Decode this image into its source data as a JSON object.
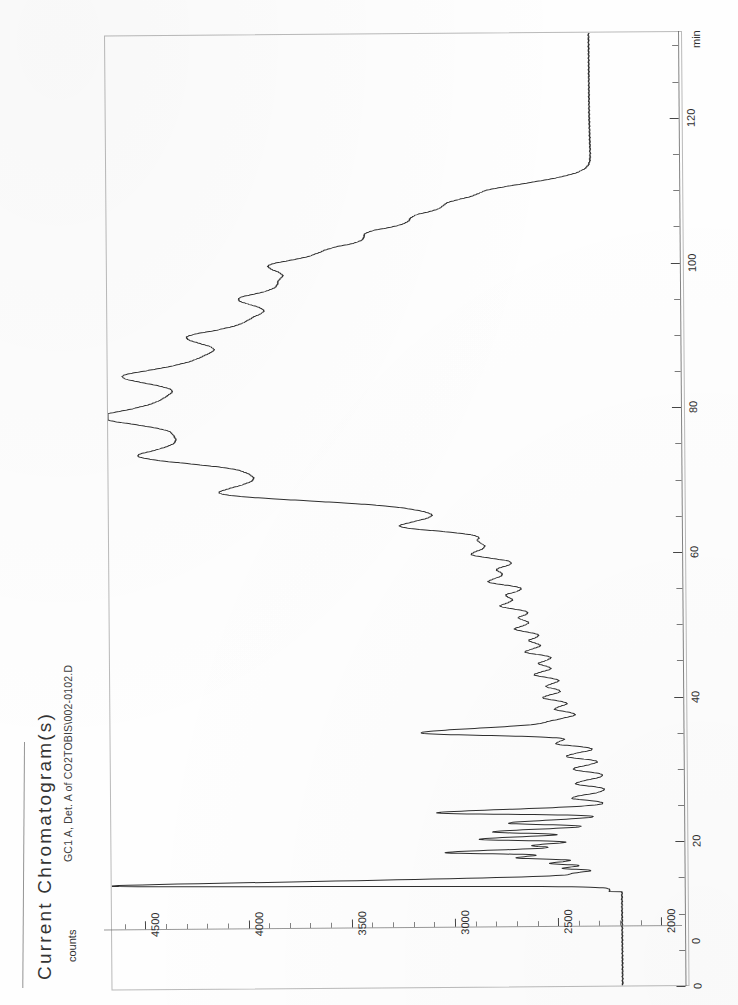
{
  "report": {
    "title": "Current Chromatogram(s)",
    "subtitle": "GC1 A, Det. A of CO2TOBIS\\002-0102.D"
  },
  "axes": {
    "x_unit": "min",
    "y_unit": "counts",
    "origin_label": "0",
    "x_ticks": [
      "0",
      "20",
      "40",
      "60",
      "80",
      "100",
      "120"
    ],
    "y_ticks": [
      "4500",
      "4000",
      "3500",
      "3000",
      "2500",
      "2000"
    ]
  },
  "chart_data": {
    "type": "line",
    "title": "Current Chromatogram(s)",
    "subtitle": "GC1 A, Det. A of CO2TOBIS\\002-0102.D",
    "xlabel": "min",
    "ylabel": "counts",
    "xlim": [
      0,
      132
    ],
    "ylim": [
      1900,
      4700
    ],
    "xticks": [
      0,
      20,
      40,
      60,
      80,
      100,
      120
    ],
    "yticks": [
      2000,
      2500,
      3000,
      3500,
      4000,
      4500
    ],
    "grid": false,
    "legend": null,
    "orientation": "rotated-90",
    "baseline": 2280,
    "series": [
      {
        "name": "Det. A signal",
        "peaks": [
          {
            "t": 14.3,
            "height": 4720,
            "width": 0.3,
            "label": "solvent"
          },
          {
            "t": 15.0,
            "height": 2460,
            "width": 0.22
          },
          {
            "t": 15.6,
            "height": 2420,
            "width": 0.2
          },
          {
            "t": 16.3,
            "height": 2500,
            "width": 0.2
          },
          {
            "t": 17.0,
            "height": 2560,
            "width": 0.22
          },
          {
            "t": 17.8,
            "height": 2720,
            "width": 0.25
          },
          {
            "t": 18.6,
            "height": 3050,
            "width": 0.26
          },
          {
            "t": 19.5,
            "height": 2620,
            "width": 0.24
          },
          {
            "t": 20.4,
            "height": 2900,
            "width": 0.26
          },
          {
            "t": 21.4,
            "height": 2830,
            "width": 0.26
          },
          {
            "t": 22.6,
            "height": 2760,
            "width": 0.28
          },
          {
            "t": 24.1,
            "height": 3110,
            "width": 0.3
          },
          {
            "t": 26.0,
            "height": 2450,
            "width": 0.35
          },
          {
            "t": 28.0,
            "height": 2430,
            "width": 0.38
          },
          {
            "t": 30.0,
            "height": 2440,
            "width": 0.4
          },
          {
            "t": 31.8,
            "height": 2470,
            "width": 0.42
          },
          {
            "t": 33.6,
            "height": 2520,
            "width": 0.45
          },
          {
            "t": 35.2,
            "height": 3170,
            "width": 0.5
          },
          {
            "t": 36.8,
            "height": 2480,
            "width": 0.5
          },
          {
            "t": 38.4,
            "height": 2510,
            "width": 0.52
          },
          {
            "t": 40.0,
            "height": 2560,
            "width": 0.55
          },
          {
            "t": 41.6,
            "height": 2530,
            "width": 0.55
          },
          {
            "t": 43.2,
            "height": 2590,
            "width": 0.58
          },
          {
            "t": 44.8,
            "height": 2550,
            "width": 0.58
          },
          {
            "t": 46.4,
            "height": 2620,
            "width": 0.6
          },
          {
            "t": 48.0,
            "height": 2580,
            "width": 0.62
          },
          {
            "t": 49.6,
            "height": 2650,
            "width": 0.65
          },
          {
            "t": 51.2,
            "height": 2600,
            "width": 0.65
          },
          {
            "t": 52.8,
            "height": 2700,
            "width": 0.68
          },
          {
            "t": 54.4,
            "height": 2630,
            "width": 0.7
          },
          {
            "t": 56.2,
            "height": 2760,
            "width": 0.75
          },
          {
            "t": 58.0,
            "height": 2660,
            "width": 0.78
          },
          {
            "t": 60.0,
            "height": 2830,
            "width": 0.85
          },
          {
            "t": 62.0,
            "height": 2700,
            "width": 0.9
          },
          {
            "t": 64.0,
            "height": 3120,
            "width": 1.0
          },
          {
            "t": 66.4,
            "height": 2710,
            "width": 1.1
          },
          {
            "t": 68.8,
            "height": 3980,
            "width": 1.6
          },
          {
            "t": 71.6,
            "height": 2740,
            "width": 1.3
          },
          {
            "t": 74.2,
            "height": 4230,
            "width": 1.9
          },
          {
            "t": 77.0,
            "height": 2760,
            "width": 1.4
          },
          {
            "t": 79.8,
            "height": 4260,
            "width": 2.0
          },
          {
            "t": 82.6,
            "height": 2780,
            "width": 1.5
          },
          {
            "t": 85.4,
            "height": 4050,
            "width": 1.9
          },
          {
            "t": 88.2,
            "height": 2800,
            "width": 1.5
          },
          {
            "t": 90.8,
            "height": 3730,
            "width": 1.8
          },
          {
            "t": 93.4,
            "height": 2800,
            "width": 1.4
          },
          {
            "t": 96.0,
            "height": 3560,
            "width": 1.7
          },
          {
            "t": 98.4,
            "height": 2790,
            "width": 1.3
          },
          {
            "t": 100.6,
            "height": 3340,
            "width": 1.5
          },
          {
            "t": 102.8,
            "height": 2770,
            "width": 1.2
          },
          {
            "t": 105.0,
            "height": 2990,
            "width": 1.3
          },
          {
            "t": 107.2,
            "height": 2720,
            "width": 1.1
          },
          {
            "t": 109.0,
            "height": 2640,
            "width": 1.0
          },
          {
            "t": 110.6,
            "height": 2520,
            "width": 0.9
          }
        ]
      }
    ]
  }
}
